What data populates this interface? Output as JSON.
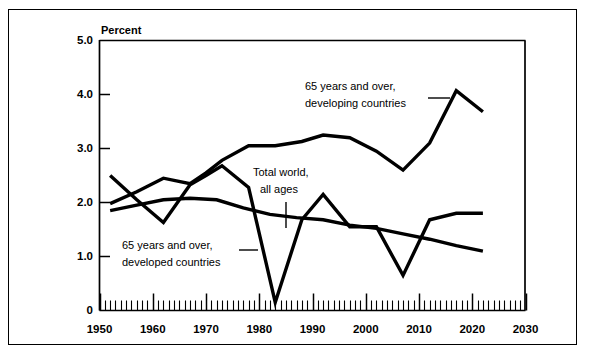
{
  "figure": {
    "unit_label": "Percent",
    "frame": true,
    "background_color": "#ffffff",
    "ink_color": "#000000"
  },
  "chart_data": {
    "type": "line",
    "title": "",
    "subtitle": "",
    "xlabel": "",
    "ylabel": "Percent",
    "xlim": [
      1950,
      2030
    ],
    "ylim": [
      0,
      5.0
    ],
    "grid": false,
    "legend_position": "inline-annotations",
    "x_major_ticks": [
      1950,
      1960,
      1970,
      1980,
      1990,
      2000,
      2010,
      2020,
      2030
    ],
    "x_major_tick_labels": [
      "1950",
      "1960",
      "1970",
      "1980",
      "1990",
      "2000",
      "2010",
      "2020",
      "2030"
    ],
    "x_minor_tick_interval": 1,
    "y_ticks": [
      0,
      1.0,
      2.0,
      3.0,
      4.0,
      5.0
    ],
    "y_tick_labels": [
      "0",
      "1.0",
      "2.0",
      "3.0",
      "4.0",
      "5.0"
    ],
    "series": [
      {
        "name": "65 years and over, developing countries",
        "annotation": "65 years and over,\ndeveloping countries",
        "x": [
          1952,
          1957,
          1962,
          1967,
          1970,
          1973,
          1978,
          1983,
          1988,
          1992,
          1997,
          2002,
          2007,
          2012,
          2017,
          2022
        ],
        "values": [
          1.98,
          2.2,
          2.45,
          2.35,
          2.55,
          2.78,
          3.05,
          3.05,
          3.13,
          3.25,
          3.2,
          2.95,
          2.6,
          3.1,
          4.07,
          3.68
        ]
      },
      {
        "name": "65 years and over, developed countries",
        "annotation": "65 years and over,\ndeveloped countries",
        "x": [
          1952,
          1957,
          1962,
          1967,
          1970,
          1973,
          1978,
          1983,
          1988,
          1992,
          1997,
          2002,
          2007,
          2012,
          2017,
          2022
        ],
        "values": [
          2.5,
          2.05,
          1.63,
          2.33,
          2.5,
          2.68,
          2.28,
          0.15,
          1.68,
          2.15,
          1.55,
          1.55,
          0.65,
          1.68,
          1.8,
          1.8
        ]
      },
      {
        "name": "Total world, all ages",
        "annotation": "Total world,\nall ages",
        "x": [
          1952,
          1957,
          1962,
          1967,
          1972,
          1977,
          1982,
          1987,
          1992,
          1997,
          2002,
          2007,
          2012,
          2017,
          2022
        ],
        "values": [
          1.85,
          1.95,
          2.05,
          2.08,
          2.05,
          1.9,
          1.78,
          1.72,
          1.68,
          1.58,
          1.52,
          1.42,
          1.32,
          1.2,
          1.1
        ]
      }
    ],
    "annotations": [
      {
        "name": "developing-countries-label",
        "lines": [
          "65 years and over,",
          "developing countries"
        ],
        "leader": "horizontal-right"
      },
      {
        "name": "total-world-label",
        "lines": [
          "Total world,",
          "all ages"
        ],
        "leader": "vertical-down"
      },
      {
        "name": "developed-countries-label",
        "lines": [
          "65 years and over,",
          "developed countries"
        ],
        "leader": "horizontal-right"
      }
    ]
  }
}
